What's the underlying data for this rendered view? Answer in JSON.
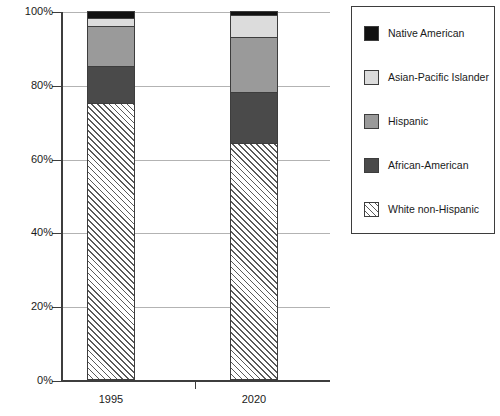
{
  "chart_data": {
    "type": "bar",
    "subtype": "stacked-bar-100-percent",
    "title": "",
    "xlabel": "",
    "ylabel": "",
    "categories": [
      "1995",
      "2020"
    ],
    "ylim": [
      0,
      100
    ],
    "yticks": [
      0,
      20,
      40,
      60,
      80,
      100
    ],
    "ytick_labels": [
      "0%",
      "20%",
      "40%",
      "60%",
      "80%",
      "100%"
    ],
    "grid": true,
    "legend_position": "right",
    "stack_order_bottom_to_top": [
      "White non-Hispanic",
      "African-American",
      "Hispanic",
      "Asian-Pacific Islander",
      "Native American"
    ],
    "series": [
      {
        "name": "White non-Hispanic",
        "color": "#ffffff",
        "pattern": "diagonal-hatch",
        "values": [
          75,
          64
        ]
      },
      {
        "name": "African-American",
        "color": "#4a4a4a",
        "pattern": "solid",
        "values": [
          10,
          14
        ]
      },
      {
        "name": "Hispanic",
        "color": "#9a9a9a",
        "pattern": "solid",
        "values": [
          11,
          15
        ]
      },
      {
        "name": "Asian-Pacific Islander",
        "color": "#dcdcdc",
        "pattern": "solid",
        "values": [
          2,
          6
        ]
      },
      {
        "name": "Native American",
        "color": "#111111",
        "pattern": "solid",
        "values": [
          2,
          1
        ]
      }
    ]
  },
  "axes": {
    "y_labels": [
      "100%",
      "80%",
      "60%",
      "40%",
      "20%",
      "0%"
    ],
    "x_labels": [
      "1995",
      "2020"
    ]
  },
  "legend": {
    "items": [
      {
        "label": "Native American",
        "swatch": "native-american-swatch"
      },
      {
        "label": "Asian-Pacific Islander",
        "swatch": "asian-pacific-islander-swatch"
      },
      {
        "label": "Hispanic",
        "swatch": "hispanic-swatch"
      },
      {
        "label": "African-American",
        "swatch": "african-american-swatch"
      },
      {
        "label": "White non-Hispanic",
        "swatch": "white-non-hispanic-swatch"
      }
    ]
  },
  "colors": {
    "native_american": "#111111",
    "asian_pacific_islander": "#dcdcdc",
    "hispanic": "#9a9a9a",
    "african_american": "#4a4a4a",
    "white_non_hispanic": "#ffffff",
    "axis": "#3d3d3d",
    "gridline": "#b3b3b3",
    "background": "#ffffff"
  }
}
